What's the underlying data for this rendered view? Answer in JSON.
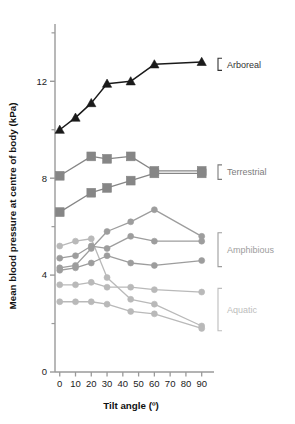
{
  "figure": {
    "title": "",
    "background": "#ffffff"
  },
  "axes": {
    "y": {
      "label": "Mean blood pressure at centre of body (kPa)",
      "ticks": [
        0,
        4,
        8,
        12
      ],
      "tick_labels": [
        "0",
        "4",
        "8",
        "12"
      ],
      "minor_ticks": [
        2,
        6,
        10,
        14
      ],
      "limits": [
        0,
        14.2
      ]
    },
    "x": {
      "label": "Tilt angle (º)",
      "ticks": [
        0,
        10,
        20,
        30,
        40,
        50,
        60,
        70,
        80,
        90
      ],
      "tick_labels": [
        "0",
        "10",
        "20",
        "30",
        "40",
        "50",
        "60",
        "70",
        "80",
        "90"
      ],
      "limits": [
        -3,
        94
      ]
    }
  },
  "groups": [
    {
      "name": "arboreal",
      "label": "Arboreal",
      "color": "#1a1a1a",
      "marker": "triangle"
    },
    {
      "name": "terrestrial",
      "label": "Terrestrial",
      "color": "#868686",
      "marker": "square"
    },
    {
      "name": "amphibious",
      "label": "Amphibious",
      "color": "#9d9d9d",
      "marker": "circle"
    },
    {
      "name": "aquatic",
      "label": "Aquatic",
      "color": "#b9b9b9",
      "marker": "circle"
    }
  ],
  "chart_data": {
    "type": "line",
    "title": "",
    "xlabel": "Tilt angle (º)",
    "ylabel": "Mean blood pressure at centre of body (kPa)",
    "xlim": [
      -3,
      94
    ],
    "ylim": [
      0,
      14.2
    ],
    "grid": false,
    "legend_position": "right-bracketed-annotations",
    "x": [
      0,
      10,
      20,
      30,
      45,
      60,
      90
    ],
    "series": [
      {
        "name": "Arboreal snake",
        "group": "arboreal",
        "color": "#1a1a1a",
        "marker": "triangle",
        "x": [
          0,
          10,
          20,
          30,
          45,
          60,
          90
        ],
        "values": [
          10.0,
          10.5,
          11.1,
          11.9,
          12.0,
          12.7,
          12.8
        ]
      },
      {
        "name": "Terrestrial 1",
        "group": "terrestrial",
        "color": "#868686",
        "marker": "square",
        "x": [
          0,
          20,
          30,
          45,
          60,
          90
        ],
        "values": [
          8.1,
          8.9,
          8.8,
          8.9,
          8.3,
          8.3
        ]
      },
      {
        "name": "Terrestrial 2",
        "group": "terrestrial",
        "color": "#868686",
        "marker": "square",
        "x": [
          0,
          20,
          30,
          45,
          60,
          90
        ],
        "values": [
          6.6,
          7.4,
          7.6,
          7.9,
          8.2,
          8.2
        ]
      },
      {
        "name": "Amphibious 1",
        "group": "amphibious",
        "color": "#9d9d9d",
        "marker": "circle",
        "x": [
          0,
          10,
          20,
          30,
          45,
          60,
          90
        ],
        "values": [
          4.3,
          4.4,
          5.1,
          5.8,
          6.2,
          6.7,
          5.6
        ]
      },
      {
        "name": "Amphibious 2",
        "group": "amphibious",
        "color": "#9d9d9d",
        "marker": "circle",
        "x": [
          0,
          10,
          20,
          30,
          45,
          60,
          90
        ],
        "values": [
          4.7,
          4.8,
          5.2,
          5.1,
          5.6,
          5.4,
          5.4
        ]
      },
      {
        "name": "Amphibious 3",
        "group": "amphibious",
        "color": "#9d9d9d",
        "marker": "circle",
        "x": [
          0,
          10,
          20,
          30,
          45,
          60,
          90
        ],
        "values": [
          4.2,
          4.3,
          4.5,
          4.8,
          4.5,
          4.4,
          4.6
        ]
      },
      {
        "name": "Aquatic 1",
        "group": "aquatic",
        "color": "#b9b9b9",
        "marker": "circle",
        "x": [
          0,
          10,
          20,
          30,
          45,
          60,
          90
        ],
        "values": [
          3.6,
          3.6,
          3.7,
          3.5,
          3.5,
          3.4,
          3.3
        ]
      },
      {
        "name": "Aquatic 2",
        "group": "aquatic",
        "color": "#b9b9b9",
        "marker": "circle",
        "x": [
          0,
          10,
          20,
          30,
          45,
          60,
          90
        ],
        "values": [
          5.2,
          5.4,
          5.5,
          3.9,
          3.0,
          2.8,
          1.9
        ]
      },
      {
        "name": "Aquatic 3",
        "group": "aquatic",
        "color": "#b9b9b9",
        "marker": "circle",
        "x": [
          0,
          10,
          20,
          30,
          45,
          60,
          90
        ],
        "values": [
          2.9,
          2.9,
          2.9,
          2.8,
          2.5,
          2.4,
          1.8
        ]
      }
    ],
    "annotations": [
      {
        "label": "Arboreal",
        "y_top": 12.95,
        "y_bottom": 12.45,
        "color": "#333333"
      },
      {
        "label": "Terrestrial",
        "y_top": 8.55,
        "y_bottom": 7.95,
        "color": "#7c7c7c"
      },
      {
        "label": "Amphibious",
        "y_top": 5.75,
        "y_bottom": 4.35,
        "color": "#9d9d9d"
      },
      {
        "label": "Aquatic",
        "y_top": 3.45,
        "y_bottom": 1.7,
        "color": "#bdbdbd"
      }
    ]
  }
}
